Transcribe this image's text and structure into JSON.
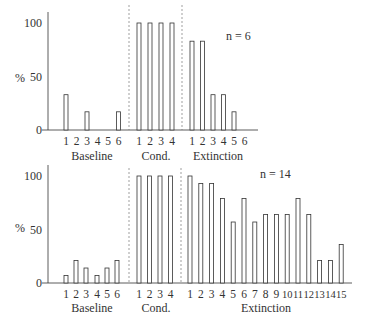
{
  "chart_data": [
    {
      "type": "bar",
      "title": "",
      "annotation": "n = 6",
      "ylabel": "%",
      "xlabel": "",
      "ylim": [
        0,
        100
      ],
      "yticks": [
        0,
        50,
        100
      ],
      "grid": false,
      "phases": [
        {
          "name": "Baseline",
          "categories": [
            "1",
            "2",
            "3",
            "4",
            "5",
            "6"
          ],
          "values": [
            33,
            0,
            17,
            0,
            0,
            17
          ]
        },
        {
          "name": "Cond.",
          "categories": [
            "1",
            "2",
            "3",
            "4"
          ],
          "values": [
            100,
            100,
            100,
            100
          ]
        },
        {
          "name": "Extinction",
          "categories": [
            "1",
            "2",
            "3",
            "4",
            "5",
            "6"
          ],
          "values": [
            83,
            83,
            33,
            33,
            17,
            0
          ]
        }
      ]
    },
    {
      "type": "bar",
      "title": "",
      "annotation": "n = 14",
      "ylabel": "%",
      "xlabel": "",
      "ylim": [
        0,
        100
      ],
      "yticks": [
        0,
        50,
        100
      ],
      "grid": false,
      "phases": [
        {
          "name": "Baseline",
          "categories": [
            "1",
            "2",
            "3",
            "4",
            "5",
            "6"
          ],
          "values": [
            7,
            21,
            14,
            7,
            14,
            21
          ]
        },
        {
          "name": "Cond.",
          "categories": [
            "1",
            "2",
            "3",
            "4"
          ],
          "values": [
            100,
            100,
            100,
            100
          ]
        },
        {
          "name": "Extinction",
          "categories": [
            "1",
            "2",
            "3",
            "4",
            "5",
            "6",
            "7",
            "8",
            "9",
            "10",
            "11",
            "12",
            "13",
            "14",
            "15"
          ],
          "values": [
            100,
            93,
            93,
            79,
            57,
            79,
            57,
            64,
            64,
            64,
            79,
            64,
            21,
            21,
            36
          ]
        }
      ]
    }
  ],
  "labels": {
    "top_annotation": "n = 6",
    "bottom_annotation": "n = 14",
    "ylabel": "%",
    "ytick_0": "0",
    "ytick_50": "50",
    "ytick_100": "100",
    "phase_baseline": "Baseline",
    "phase_cond": "Cond.",
    "phase_extinction": "Extinction"
  },
  "colors": {
    "ink": "#333333",
    "dashed": "#777777",
    "background": "#ffffff"
  }
}
